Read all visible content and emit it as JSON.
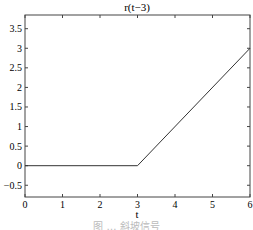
{
  "chart_data": {
    "type": "line",
    "title": "r(t−3)",
    "xlabel": "t",
    "ylabel": "",
    "xlim": [
      0,
      6
    ],
    "ylim": [
      -0.8,
      3.85
    ],
    "x_ticks": [
      "0",
      "1",
      "2",
      "3",
      "4",
      "5",
      "6"
    ],
    "y_ticks": [
      "−0.5",
      "0",
      "0.5",
      "1",
      "1.5",
      "2",
      "2.5",
      "3",
      "3.5"
    ],
    "series": [
      {
        "name": "r(t-3)",
        "x": [
          0,
          3,
          6
        ],
        "y": [
          0,
          0,
          3
        ]
      }
    ],
    "grid": false,
    "legend": null
  },
  "caption": "图 … 斜坡信号"
}
